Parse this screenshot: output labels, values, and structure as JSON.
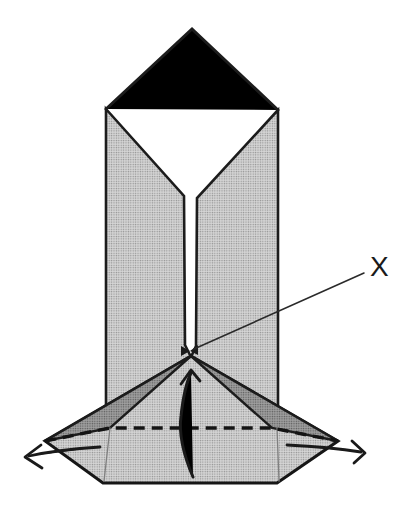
{
  "figure": {
    "point_label": "X",
    "palette": {
      "background": "#ffffff",
      "paper_light": "#c5c5c5",
      "paper_light_bg": "#d6d6d6",
      "paper_light_dot": "#909090",
      "paper_shadow": "#8d8d8d",
      "paper_shadow_bg": "#9f9f9f",
      "paper_shadow_dot": "#5a5a5a",
      "outline": "#1c1c1c",
      "crease": "#7f7f7f"
    },
    "icons": {
      "pull_left_arrow": "open-v-arrow-left",
      "pull_right_arrow": "open-v-arrow-right",
      "lift_up_arrow": "curved-arrow-up",
      "fold_line": "dashed-valley-fold-line",
      "x_point_marker": "bowtie-mark"
    }
  }
}
